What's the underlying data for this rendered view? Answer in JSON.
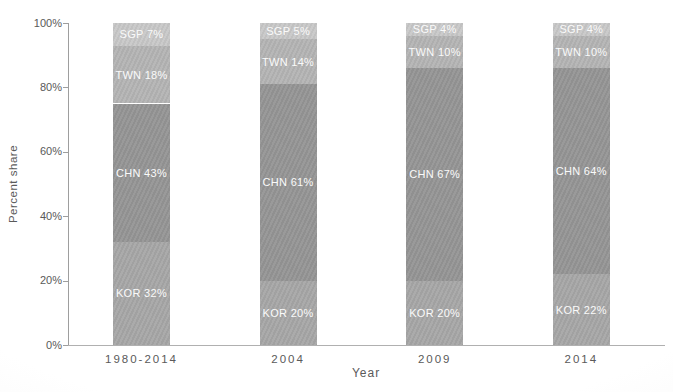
{
  "chart_data": {
    "type": "bar",
    "stacked": true,
    "orientation": "vertical",
    "title": "",
    "xlabel": "Year",
    "ylabel": "Percent share",
    "ylim": [
      0,
      100
    ],
    "ytick_labels": [
      "0%",
      "20%",
      "40%",
      "60%",
      "80%",
      "100%"
    ],
    "ytick_values": [
      0,
      20,
      40,
      60,
      80,
      100
    ],
    "grid": false,
    "legend": "none (labels inside segments)",
    "categories": [
      "1980-2014",
      "2004",
      "2009",
      "2014"
    ],
    "series": [
      {
        "name": "KOR",
        "color": "#a7a7a7",
        "values": [
          32,
          20,
          20,
          22
        ],
        "labels": [
          "KOR 32%",
          "KOR 20%",
          "KOR 20%",
          "KOR 22%"
        ]
      },
      {
        "name": "CHN",
        "color": "#959595",
        "values": [
          43,
          61,
          67,
          64
        ],
        "labels": [
          "CHN 43%",
          "CHN 61%",
          "CHN 67%",
          "CHN 64%"
        ]
      },
      {
        "name": "TWN",
        "color": "#b4b4b4",
        "values": [
          18,
          14,
          10,
          10
        ],
        "labels": [
          "TWN 18%",
          "TWN 14%",
          "TWN 10%",
          "TWN 10%"
        ]
      },
      {
        "name": "SGP",
        "color": "#c8c8c8",
        "values": [
          7,
          5,
          4,
          4
        ],
        "labels": [
          "SGP 7%",
          "SGP 5%",
          "SGP 4%",
          "SGP 4%"
        ]
      }
    ],
    "segment_label_color": "#fafafa",
    "axis_color": "#9e9e9e",
    "tick_text_color": "#595959"
  }
}
